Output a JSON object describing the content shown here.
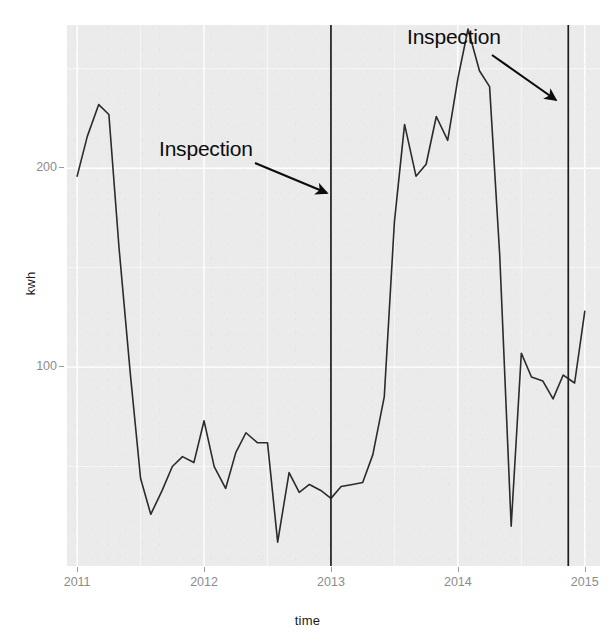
{
  "chart_data": {
    "type": "line",
    "title": "",
    "xlabel": "time",
    "ylabel": "kwh",
    "xlim": [
      2010.92,
      2015.12
    ],
    "ylim": [
      0,
      272
    ],
    "grid": true,
    "legend": "none",
    "x_ticks": [
      "2011",
      "2012",
      "2013",
      "2014",
      "2015"
    ],
    "x_tick_values": [
      2011,
      2012,
      2013,
      2014,
      2015
    ],
    "y_ticks": [
      "100",
      "200"
    ],
    "y_tick_values": [
      100,
      200
    ],
    "line_color": "#2b2b2b",
    "panel_color": "#ebebeb",
    "grid_color": "#ffffff",
    "series": [
      {
        "name": "kwh",
        "x": [
          2011.0,
          2011.08,
          2011.17,
          2011.25,
          2011.33,
          2011.42,
          2011.5,
          2011.58,
          2011.67,
          2011.75,
          2011.83,
          2011.92,
          2012.0,
          2012.08,
          2012.17,
          2012.25,
          2012.33,
          2012.42,
          2012.5,
          2012.58,
          2012.67,
          2012.75,
          2012.83,
          2012.92,
          2013.0,
          2013.08,
          2013.17,
          2013.25,
          2013.33,
          2013.42,
          2013.5,
          2013.58,
          2013.67,
          2013.75,
          2013.83,
          2013.92,
          2014.0,
          2014.08,
          2014.17,
          2014.25,
          2014.33,
          2014.42,
          2014.5,
          2014.58,
          2014.67,
          2014.75,
          2014.83,
          2014.92,
          2015.0
        ],
        "values": [
          196,
          216,
          232,
          227,
          160,
          96,
          44,
          26,
          38,
          50,
          55,
          52,
          73,
          50,
          39,
          57,
          67,
          62,
          62,
          12,
          47,
          37,
          41,
          38,
          34,
          40,
          41,
          42,
          56,
          85,
          173,
          222,
          196,
          202,
          226,
          214,
          245,
          270,
          249,
          241,
          156,
          20,
          107,
          95,
          93,
          84,
          96,
          92,
          128
        ]
      }
    ],
    "annotations": [
      {
        "text": "Inspection",
        "label_x": 2012.0,
        "label_y": 238,
        "target_x": 2013.0,
        "target_y": 196,
        "arrow": true
      },
      {
        "text": "Inspection",
        "label_x": 2013.85,
        "label_y": 272,
        "target_x": 2014.87,
        "target_y": 239,
        "arrow": true
      }
    ],
    "vlines": [
      {
        "x": 2013.0,
        "label": "Inspection",
        "color": "#1c1c1c"
      },
      {
        "x": 2014.87,
        "label": "Inspection",
        "color": "#1c1c1c"
      }
    ]
  }
}
